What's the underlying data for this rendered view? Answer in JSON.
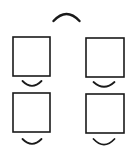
{
  "diagram": {
    "stroke_color": "#1a1a1a",
    "background": "#ffffff",
    "top_arc": {
      "shape": "frown-arc",
      "cx": 66.5,
      "y": 21,
      "width": 26,
      "rise": 7,
      "stroke_width": 2.4
    },
    "boxes": [
      {
        "id": "top-left",
        "x": 13,
        "y": 37,
        "w": 37,
        "h": 39,
        "arc": {
          "shape": "smile-arc",
          "cx": 32,
          "y": 81,
          "width": 19,
          "dip": 6
        }
      },
      {
        "id": "top-right",
        "x": 86,
        "y": 38,
        "w": 38,
        "h": 39,
        "arc": {
          "shape": "smile-arc",
          "cx": 104,
          "y": 82,
          "width": 21,
          "dip": 6
        }
      },
      {
        "id": "bottom-left",
        "x": 13,
        "y": 93,
        "w": 37,
        "h": 39,
        "arc": {
          "shape": "smile-arc",
          "cx": 32,
          "y": 139,
          "width": 19,
          "dip": 6
        }
      },
      {
        "id": "bottom-right",
        "x": 86,
        "y": 94,
        "w": 38,
        "h": 39,
        "arc": {
          "shape": "smile-arc",
          "cx": 104,
          "y": 139,
          "width": 21,
          "dip": 7
        }
      }
    ]
  }
}
